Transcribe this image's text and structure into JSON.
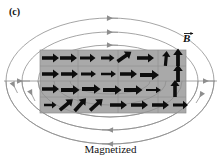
{
  "figure": {
    "panel_label": "(c)",
    "caption": "Magnetized",
    "field_label": "B",
    "field_label_kind": "vector-B",
    "colors": {
      "magnet_fill": "#a9a9a9",
      "magnet_stroke": "#6e6e6e",
      "field_line": "#8e8e8e",
      "domain_arrow": "#0d0d0d",
      "background": "#ffffff",
      "text": "#111111"
    },
    "magnet": {
      "x": 40,
      "y": 50,
      "width": 146,
      "height": 63,
      "rows": 4,
      "domain_walls_vertical_x": [
        78,
        118,
        158
      ],
      "description": "gray rectangular bar magnet with aligned magnetic domains"
    },
    "domain_arrows": [
      {
        "row": 1,
        "angles_deg": [
          0,
          0,
          0,
          0,
          35,
          0,
          0,
          88,
          90
        ]
      },
      {
        "row": 2,
        "angles_deg": [
          0,
          0,
          0,
          0,
          0,
          0,
          0,
          0,
          90
        ]
      },
      {
        "row": 3,
        "angles_deg": [
          0,
          0,
          0,
          0,
          0,
          0,
          0,
          0,
          90
        ]
      },
      {
        "row": 4,
        "angles_deg": [
          0,
          40,
          48,
          42,
          0,
          0,
          0,
          0,
          0
        ]
      }
    ],
    "field_lines": {
      "count": 5,
      "direction": "leftward",
      "arrowhead_count": 9,
      "shape": "nested ellipses around the bar magnet"
    }
  }
}
